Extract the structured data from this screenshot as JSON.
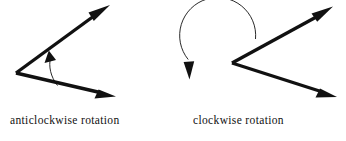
{
  "figure": {
    "title": "",
    "background_color": "#ffffff",
    "ink_color": "#111111",
    "width": 346,
    "height": 141,
    "diagrams": [
      {
        "id": "anticlockwise",
        "caption": "anticlockwise rotation",
        "rotation_direction": "anticlockwise",
        "angle_type": "acute-to-obtuse interior angle",
        "vertex": {
          "x": 16,
          "y": 73
        },
        "rays": [
          {
            "name": "initial-ray",
            "from": {
              "x": 16,
              "y": 73
            },
            "to": {
              "x": 110,
              "y": 95
            },
            "arrowhead": "filled-triangle",
            "arrow_at": "end"
          },
          {
            "name": "terminal-ray",
            "from": {
              "x": 16,
              "y": 73
            },
            "to": {
              "x": 105,
              "y": 8
            },
            "arrowhead": "filled-triangle",
            "arrow_at": "end"
          }
        ],
        "rotation_arc": {
          "name": "rotation-arc",
          "sweep": "minor",
          "arrow_position": "upper-end",
          "arrow_direction": "up-left",
          "radius": 42
        }
      },
      {
        "id": "clockwise",
        "caption": "clockwise rotation",
        "rotation_direction": "clockwise",
        "angle_type": "reflex exterior angle",
        "vertex": {
          "x": 232,
          "y": 63
        },
        "rays": [
          {
            "name": "initial-ray",
            "from": {
              "x": 232,
              "y": 63
            },
            "to": {
              "x": 332,
              "y": 95
            },
            "arrowhead": "filled-triangle",
            "arrow_at": "end"
          },
          {
            "name": "terminal-ray",
            "from": {
              "x": 232,
              "y": 63
            },
            "to": {
              "x": 330,
              "y": 8
            },
            "arrowhead": "filled-triangle",
            "arrow_at": "end"
          }
        ],
        "rotation_arc": {
          "name": "rotation-arc",
          "sweep": "reflex",
          "center": {
            "x": 225,
            "y": 66
          },
          "radius": 38,
          "arrow_position": "left-side",
          "arrow_direction": "down"
        }
      }
    ]
  }
}
